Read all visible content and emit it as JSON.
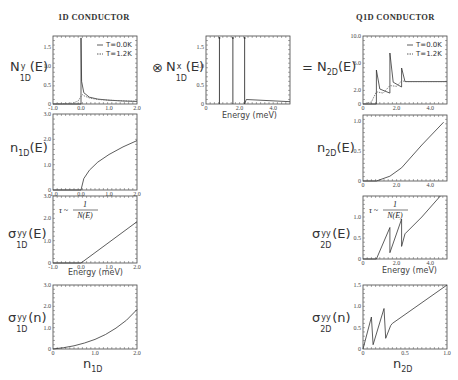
{
  "titles": {
    "left": "1D CONDUCTOR",
    "right": "Q1D CONDUCTOR"
  },
  "operators": {
    "convolve": "⊗",
    "equals": "="
  },
  "labels": {
    "N1Dy": {
      "base": "N",
      "sup": "y",
      "sub": "1D",
      "arg": "(E)"
    },
    "N1Dx": {
      "base": "N",
      "sup": "x",
      "sub": "1D",
      "arg": "(E)"
    },
    "N2D": {
      "base": "N",
      "sub": "2D",
      "arg": "(E)"
    },
    "n1D": {
      "base": "n",
      "sub": "1D",
      "arg": "(E)"
    },
    "n2D": {
      "base": "n",
      "sub": "2D",
      "arg": "(E)"
    },
    "s1DE": {
      "base": "σ",
      "sup": "yy",
      "sub": "1D",
      "arg": "(E)"
    },
    "s2DE": {
      "base": "σ",
      "sup": "yy",
      "sub": "2D",
      "arg": "(E)"
    },
    "s1Dn": {
      "base": "σ",
      "sup": "yy",
      "sub": "1D",
      "arg": "(n)"
    },
    "s2Dn": {
      "base": "σ",
      "sup": "yy",
      "sub": "2D",
      "arg": "(n)"
    }
  },
  "xlabels": {
    "energy": "Energy (meV)",
    "n1D": {
      "base": "n",
      "sub": "1D"
    },
    "n2D": {
      "base": "n",
      "sub": "2D"
    }
  },
  "legend": {
    "solid": "T=0.0K",
    "dashed": "T=1.2K"
  },
  "annotation": {
    "tau": "τ ~",
    "num": "1",
    "den": "N(E)"
  },
  "chart_data": [
    {
      "id": "N1Dy",
      "type": "line",
      "title": "1D CONDUCTOR",
      "ylabel": "N^y_1D(E)",
      "xlabel": "",
      "xlim": [
        -1.0,
        2.0
      ],
      "ylim": [
        0,
        1.8
      ],
      "xticks": [
        "-1.0",
        "0.0",
        "1.0",
        "2.0"
      ],
      "yticks": [
        "0",
        "0.5",
        "1.0",
        "1.5"
      ],
      "legend": [
        "T=0.0K",
        "T=1.2K"
      ],
      "series": [
        {
          "name": "T=0.0K",
          "x": [
            -1.0,
            0.0,
            0.0,
            0.02,
            0.1,
            0.3,
            0.6,
            1.0,
            1.5,
            2.0
          ],
          "y": [
            0,
            0,
            1.75,
            0.6,
            0.3,
            0.18,
            0.13,
            0.1,
            0.08,
            0.07
          ]
        },
        {
          "name": "T=1.2K",
          "x": [
            -1.0,
            -0.3,
            -0.1,
            0.0,
            0.05,
            0.1,
            0.3,
            0.6,
            1.0,
            2.0
          ],
          "y": [
            0,
            0.02,
            0.08,
            0.2,
            0.25,
            0.22,
            0.16,
            0.12,
            0.1,
            0.07
          ]
        }
      ]
    },
    {
      "id": "N1Dx",
      "type": "line",
      "ylabel": "N^x_1D(E)",
      "xlabel": "Energy (meV)",
      "xlim": [
        0,
        5.0
      ],
      "ylim": [
        0,
        1.8
      ],
      "xticks": [
        "0",
        "2.0",
        "4.0"
      ],
      "yticks": [
        "0",
        "0.5",
        "1.0",
        "1.5"
      ],
      "series": [
        {
          "name": "delta peaks",
          "x": [
            0.8,
            1.6,
            2.3
          ],
          "y": [
            1.75,
            1.75,
            1.75
          ]
        },
        {
          "name": "tail",
          "x": [
            2.3,
            2.4,
            5.0
          ],
          "y": [
            0,
            0.12,
            0.06
          ]
        }
      ]
    },
    {
      "id": "N2D",
      "type": "line",
      "title": "Q1D CONDUCTOR",
      "ylabel": "N_2D(E)",
      "xlabel": "",
      "xlim": [
        0,
        5.0
      ],
      "ylim": [
        0,
        10.0
      ],
      "xticks": [
        "0",
        "2.0",
        "4.0"
      ],
      "yticks": [
        "0",
        "2.0",
        "6.0",
        "10.0"
      ],
      "legend": [
        "T=0.0K",
        "T=1.2K"
      ],
      "series": [
        {
          "name": "T=0.0K",
          "x": [
            0,
            0.8,
            0.8,
            1.0,
            1.6,
            1.6,
            1.8,
            2.3,
            2.3,
            2.5,
            5.0
          ],
          "y": [
            0,
            0,
            5.0,
            2.2,
            1.6,
            7.5,
            3.2,
            2.5,
            5.3,
            3.3,
            3.3
          ]
        },
        {
          "name": "T=1.2K",
          "x": [
            0,
            0.5,
            0.8,
            1.2,
            1.6,
            2.0,
            2.3,
            2.6,
            5.0
          ],
          "y": [
            0,
            0.3,
            1.8,
            1.6,
            2.7,
            2.6,
            3.4,
            3.3,
            3.3
          ]
        }
      ]
    },
    {
      "id": "n1D",
      "type": "line",
      "ylabel": "n_1D(E)",
      "xlim": [
        -1.0,
        2.0
      ],
      "ylim": [
        0,
        3.0
      ],
      "xticks": [
        "-1.0",
        "0.0",
        "1.0",
        "2.0"
      ],
      "yticks": [
        "0",
        "1.0",
        "2.0",
        "3.0"
      ],
      "series": [
        {
          "name": "n1D",
          "x": [
            -1.0,
            0.0,
            0.1,
            0.3,
            0.6,
            1.0,
            1.5,
            2.0
          ],
          "y": [
            0,
            0,
            0.45,
            0.78,
            1.1,
            1.4,
            1.7,
            1.95
          ]
        }
      ]
    },
    {
      "id": "n2D",
      "type": "line",
      "ylabel": "n_2D(E)",
      "xlim": [
        0,
        5.0
      ],
      "ylim": [
        0,
        1.1
      ],
      "xticks": [
        "0",
        "2.0",
        "4.0"
      ],
      "yticks": [
        "0",
        "0.5",
        "1.0"
      ],
      "series": [
        {
          "name": "n2D",
          "x": [
            0,
            0.8,
            1.6,
            2.3,
            3.5,
            4.8
          ],
          "y": [
            0,
            0,
            0.08,
            0.22,
            0.6,
            0.98
          ]
        }
      ]
    },
    {
      "id": "s1DE",
      "type": "line",
      "ylabel": "σ^yy_1D(E)",
      "xlabel": "Energy (meV)",
      "xlim": [
        -1.0,
        2.0
      ],
      "ylim": [
        0,
        3.0
      ],
      "xticks": [
        "-1.0",
        "0.0",
        "1.0",
        "2.0"
      ],
      "yticks": [
        "0",
        "1.0",
        "2.0",
        "3.0"
      ],
      "annotation": "τ ~ 1/N(E)",
      "series": [
        {
          "name": "s1DE",
          "x": [
            -1.0,
            0.0,
            2.0
          ],
          "y": [
            0,
            0,
            1.85
          ]
        }
      ]
    },
    {
      "id": "s2DE",
      "type": "line",
      "ylabel": "σ^yy_2D(E)",
      "xlabel": "Energy (meV)",
      "xlim": [
        0,
        5.0
      ],
      "ylim": [
        0,
        1.5
      ],
      "xticks": [
        "0",
        "2.0",
        "4.0"
      ],
      "yticks": [
        "0",
        "0.5",
        "1.0"
      ],
      "annotation": "τ ~ 1/N(E)",
      "series": [
        {
          "name": "s2DE",
          "x": [
            0,
            0.8,
            1.6,
            1.6,
            2.3,
            2.3,
            2.5,
            3.5,
            4.6
          ],
          "y": [
            0,
            0,
            0.75,
            0.15,
            0.95,
            0.3,
            0.6,
            1.0,
            1.5
          ]
        }
      ]
    },
    {
      "id": "s1Dn",
      "type": "line",
      "ylabel": "σ^yy_1D(n)",
      "xlabel": "n_1D",
      "xlim": [
        0,
        2.0
      ],
      "ylim": [
        0,
        3.0
      ],
      "xticks": [
        "0",
        "1.0",
        "2.0"
      ],
      "yticks": [
        "0",
        "1.0",
        "2.0",
        "3.0"
      ],
      "series": [
        {
          "name": "s1Dn",
          "x": [
            0,
            0.25,
            0.5,
            0.75,
            1.0,
            1.25,
            1.5,
            1.75,
            2.0
          ],
          "y": [
            0,
            0.06,
            0.15,
            0.28,
            0.45,
            0.68,
            0.98,
            1.35,
            1.85
          ]
        }
      ]
    },
    {
      "id": "s2Dn",
      "type": "line",
      "ylabel": "σ^yy_2D(n)",
      "xlabel": "n_2D",
      "xlim": [
        0,
        1.0
      ],
      "ylim": [
        0,
        1.5
      ],
      "xticks": [
        "0",
        "0.5",
        "1.0"
      ],
      "yticks": [
        "0",
        "0.5",
        "1.0",
        "1.5"
      ],
      "series": [
        {
          "name": "s2Dn",
          "x": [
            0,
            0.1,
            0.12,
            0.25,
            0.27,
            0.33,
            0.35,
            1.0
          ],
          "y": [
            0,
            0.75,
            0.1,
            0.95,
            0.25,
            0.55,
            0.6,
            1.5
          ]
        }
      ]
    }
  ]
}
